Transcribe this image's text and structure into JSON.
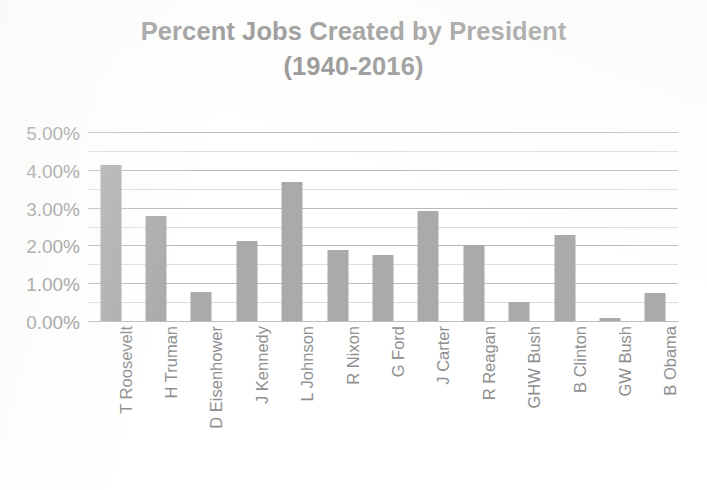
{
  "chart_data": {
    "type": "bar",
    "title": "Percent Jobs Created by President (1940-2016)",
    "title_line1": "Percent Jobs Created by President",
    "title_line2": "(1940-2016)",
    "xlabel": "",
    "ylabel": "",
    "categories": [
      "T Roosevelt",
      "H Truman",
      "D Eisenhower",
      "J Kennedy",
      "L Johnson",
      "R Nixon",
      "G Ford",
      "J Carter",
      "R Reagan",
      "GHW Bush",
      "B Clinton",
      "GW Bush",
      "B Obama"
    ],
    "values": [
      4.15,
      2.8,
      0.8,
      2.15,
      3.7,
      1.9,
      1.78,
      2.93,
      2.05,
      0.52,
      2.3,
      0.1,
      0.78
    ],
    "value_unit": "%",
    "ylim": [
      0,
      5
    ],
    "ytick_labels": [
      "0.00%",
      "1.00%",
      "2.00%",
      "3.00%",
      "4.00%",
      "5.00%"
    ],
    "ytick_values": [
      0,
      1,
      2,
      3,
      4,
      5
    ],
    "minor_gridline_step": 0.5,
    "grid": true,
    "legend": false,
    "legend_position": "none",
    "colors": {
      "bar": "#aaaaaa",
      "major_gridline": "#b9b9b9",
      "minor_gridline": "#dcdcdc",
      "axis_text": "#8f8f8f",
      "title_text": "#8d8d8d",
      "background": "#ffffff"
    }
  }
}
